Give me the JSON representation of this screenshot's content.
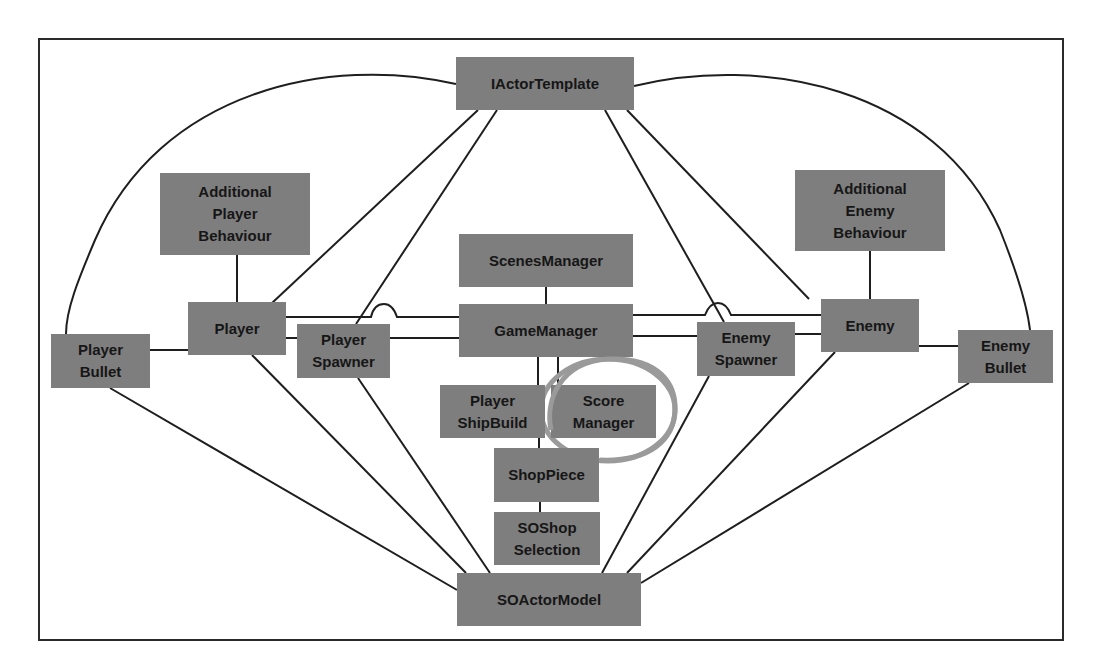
{
  "diagram": {
    "title": "",
    "colors": {
      "node_fill": "#7e7e7e",
      "node_text": "#161616",
      "edge": "#1e1e1e",
      "highlight_ring": "#9a9a9a",
      "frame": "#2a2a2a"
    },
    "nodes": [
      {
        "id": "iactortemplate",
        "label": "IActorTemplate",
        "x": 456,
        "y": 57,
        "w": 178,
        "h": 53
      },
      {
        "id": "additional-player-behaviour",
        "label": "Additional\nPlayer\nBehaviour",
        "x": 160,
        "y": 173,
        "w": 150,
        "h": 82
      },
      {
        "id": "additional-enemy-behaviour",
        "label": "Additional\nEnemy\nBehaviour",
        "x": 795,
        "y": 170,
        "w": 150,
        "h": 81
      },
      {
        "id": "scenesmanager",
        "label": "ScenesManager",
        "x": 459,
        "y": 234,
        "w": 174,
        "h": 53
      },
      {
        "id": "gamemanager",
        "label": "GameManager",
        "x": 459,
        "y": 304,
        "w": 174,
        "h": 53
      },
      {
        "id": "player",
        "label": "Player",
        "x": 188,
        "y": 302,
        "w": 98,
        "h": 53
      },
      {
        "id": "player-spawner",
        "label": "Player\nSpawner",
        "x": 297,
        "y": 324,
        "w": 93,
        "h": 54
      },
      {
        "id": "player-bullet",
        "label": "Player\nBullet",
        "x": 51,
        "y": 334,
        "w": 99,
        "h": 54
      },
      {
        "id": "enemy",
        "label": "Enemy",
        "x": 821,
        "y": 299,
        "w": 98,
        "h": 53
      },
      {
        "id": "enemy-spawner",
        "label": "Enemy\nSpawner",
        "x": 697,
        "y": 322,
        "w": 98,
        "h": 54
      },
      {
        "id": "enemy-bullet",
        "label": "Enemy\nBullet",
        "x": 958,
        "y": 330,
        "w": 95,
        "h": 53
      },
      {
        "id": "player-shipbuild",
        "label": "Player\nShipBuild",
        "x": 440,
        "y": 385,
        "w": 105,
        "h": 53
      },
      {
        "id": "score-manager",
        "label": "Score\nManager",
        "x": 551,
        "y": 385,
        "w": 105,
        "h": 53
      },
      {
        "id": "shoppiece",
        "label": "ShopPiece",
        "x": 494,
        "y": 448,
        "w": 105,
        "h": 54
      },
      {
        "id": "soshop-selection",
        "label": "SOShop\nSelection",
        "x": 494,
        "y": 512,
        "w": 106,
        "h": 53
      },
      {
        "id": "soactormodel",
        "label": "SOActorModel",
        "x": 457,
        "y": 573,
        "w": 184,
        "h": 53
      }
    ],
    "edges": [
      {
        "from": "iactortemplate",
        "to": "player-bullet",
        "shape": "arc"
      },
      {
        "from": "iactortemplate",
        "to": "enemy-bullet",
        "shape": "arc"
      },
      {
        "from": "iactortemplate",
        "to": "player"
      },
      {
        "from": "iactortemplate",
        "to": "player-spawner"
      },
      {
        "from": "iactortemplate",
        "to": "enemy-spawner"
      },
      {
        "from": "iactortemplate",
        "to": "enemy"
      },
      {
        "from": "additional-player-behaviour",
        "to": "player"
      },
      {
        "from": "additional-enemy-behaviour",
        "to": "enemy"
      },
      {
        "from": "scenesmanager",
        "to": "gamemanager"
      },
      {
        "from": "player",
        "to": "gamemanager",
        "note": "hops over IActorTemplate-PlayerSpawner line"
      },
      {
        "from": "player",
        "to": "player-spawner"
      },
      {
        "from": "player-spawner",
        "to": "gamemanager"
      },
      {
        "from": "player-bullet",
        "to": "player"
      },
      {
        "from": "gamemanager",
        "to": "enemy",
        "note": "hops over IActorTemplate-EnemySpawner line"
      },
      {
        "from": "gamemanager",
        "to": "enemy-spawner"
      },
      {
        "from": "enemy-spawner",
        "to": "enemy"
      },
      {
        "from": "enemy",
        "to": "enemy-bullet"
      },
      {
        "from": "gamemanager",
        "to": "player-shipbuild"
      },
      {
        "from": "gamemanager",
        "to": "score-manager"
      },
      {
        "from": "player-shipbuild",
        "to": "shoppiece"
      },
      {
        "from": "shoppiece",
        "to": "soshop-selection"
      },
      {
        "from": "player-bullet",
        "to": "soactormodel"
      },
      {
        "from": "player",
        "to": "soactormodel"
      },
      {
        "from": "player-spawner",
        "to": "soactormodel"
      },
      {
        "from": "enemy-spawner",
        "to": "soactormodel"
      },
      {
        "from": "enemy",
        "to": "soactormodel"
      },
      {
        "from": "enemy-bullet",
        "to": "soactormodel"
      }
    ],
    "highlight": {
      "target": "score-manager",
      "shape": "ellipse",
      "cx": 608,
      "cy": 410,
      "rx": 67,
      "ry": 51
    }
  }
}
